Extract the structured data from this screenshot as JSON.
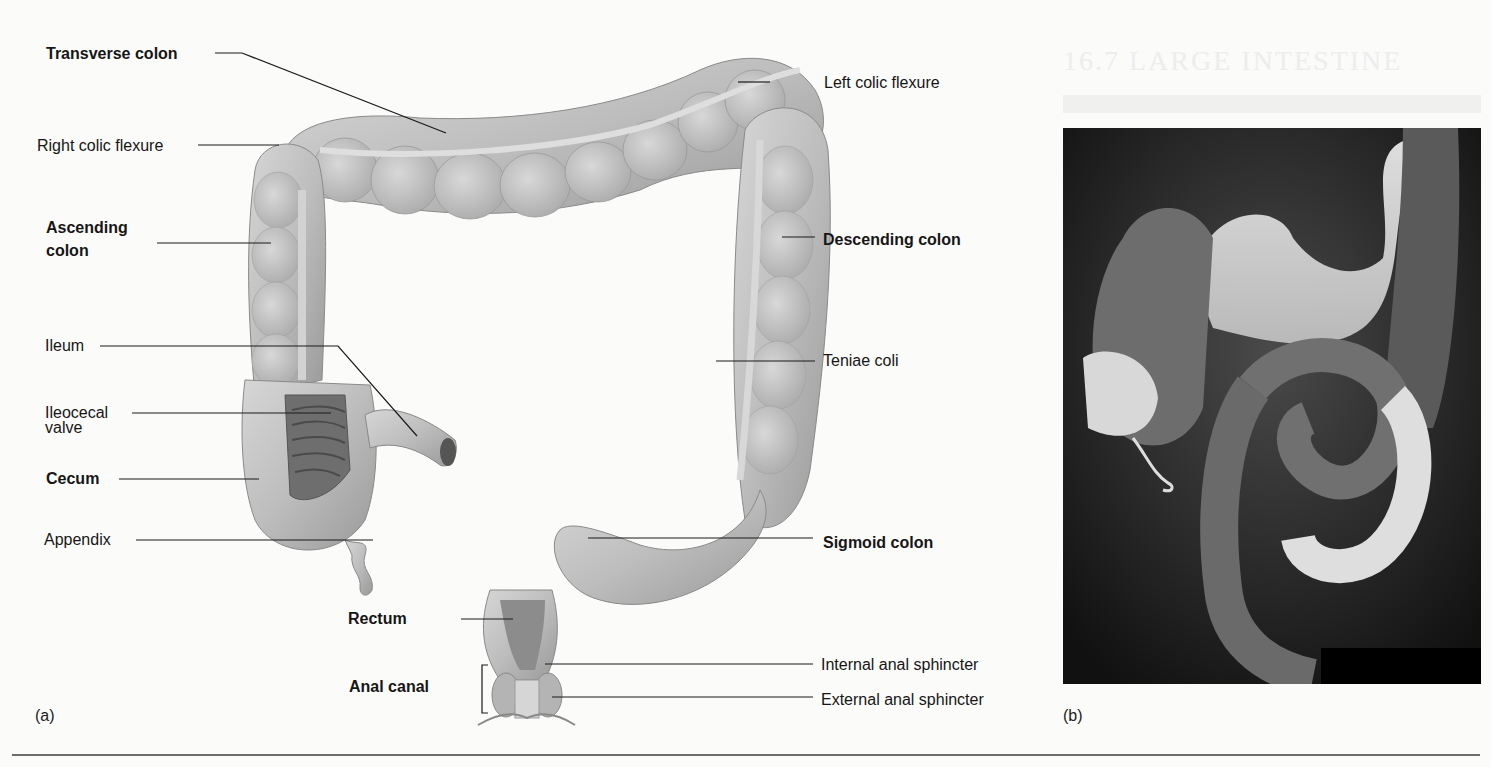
{
  "figure": {
    "panel_a_tag": "(a)",
    "panel_b_tag": "(b)",
    "background_heading": "16.7 LARGE INTESTINE"
  },
  "labels_left": [
    {
      "text": "Transverse colon",
      "bold": true
    },
    {
      "text": "Right colic flexure",
      "bold": false
    },
    {
      "text": "Ascending colon",
      "bold": true
    },
    {
      "text": "Ileum",
      "bold": false
    },
    {
      "text": "Ileocecal valve",
      "bold": false
    },
    {
      "text": "Cecum",
      "bold": true
    },
    {
      "text": "Appendix",
      "bold": false
    },
    {
      "text": "Rectum",
      "bold": true
    },
    {
      "text": "Anal canal",
      "bold": true
    }
  ],
  "labels_right": [
    {
      "text": "Left colic flexure",
      "bold": false
    },
    {
      "text": "Descending colon",
      "bold": true
    },
    {
      "text": "Teniae coli",
      "bold": false
    },
    {
      "text": "Sigmoid colon",
      "bold": true
    },
    {
      "text": "Internal anal sphincter",
      "bold": false
    },
    {
      "text": "External anal sphincter",
      "bold": false
    }
  ],
  "split_labels": {
    "ascending_line1": "Ascending",
    "ascending_line2": "colon",
    "ileocecal_line1": "Ileocecal",
    "ileocecal_line2": "valve"
  },
  "colors": {
    "tissue": "#bdbdbd",
    "tissue_dark": "#8e8e8e",
    "leader_line": "#1a1a1a",
    "xray_bg": "#0a0a0a"
  }
}
